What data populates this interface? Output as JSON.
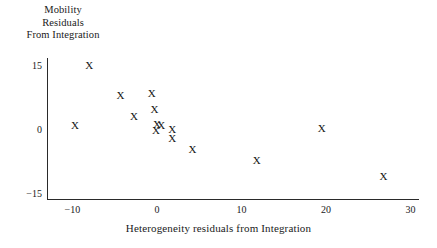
{
  "chart_data": {
    "type": "scatter",
    "title": "",
    "xlabel": "Heterogeneity residuals from Integration",
    "ylabel_lines": [
      "Mobility",
      "Residuals",
      "From Integration"
    ],
    "ylabel": "Mobility Residuals From Integration",
    "xlim": [
      -13.0,
      31.0
    ],
    "ylim": [
      -16.5,
      17.0
    ],
    "xticks": [
      -10,
      0,
      10,
      20,
      30
    ],
    "xticklabels": [
      "−10",
      "0",
      "10",
      "20",
      "30"
    ],
    "yticks": [
      15,
      0,
      -15
    ],
    "yticklabels": [
      "15",
      "0",
      "−15"
    ],
    "grid": false,
    "legend": null,
    "marker": "X",
    "marker_color": "#151515",
    "axis_color": "#2a2a2a",
    "background": "#ffffff",
    "points": [
      {
        "x": -8.0,
        "y": 15.0
      },
      {
        "x": -9.7,
        "y": 0.9
      },
      {
        "x": -4.3,
        "y": 7.9
      },
      {
        "x": -2.7,
        "y": 2.9
      },
      {
        "x": -0.6,
        "y": 8.3
      },
      {
        "x": -0.3,
        "y": 4.5
      },
      {
        "x": 0.0,
        "y": 1.1
      },
      {
        "x": 0.5,
        "y": 0.9
      },
      {
        "x": -0.1,
        "y": -0.4
      },
      {
        "x": 1.8,
        "y": 0.0
      },
      {
        "x": 1.8,
        "y": -2.2
      },
      {
        "x": 4.2,
        "y": -4.9
      },
      {
        "x": 11.8,
        "y": -7.4
      },
      {
        "x": 19.5,
        "y": 0.2
      },
      {
        "x": 26.8,
        "y": -11.0
      }
    ]
  }
}
